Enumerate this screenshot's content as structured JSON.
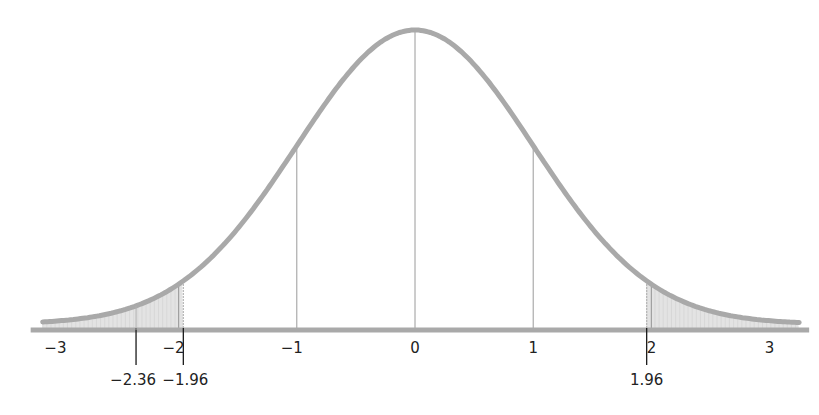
{
  "chart_data": {
    "type": "area",
    "title": "",
    "subtitle": "",
    "xlabel": "",
    "ylabel": "",
    "distribution": "standard normal",
    "xlim": [
      -3.15,
      3.25
    ],
    "ylim": [
      0,
      0.4
    ],
    "grid": false,
    "legend": null,
    "x_ticks": [
      -3,
      -2,
      -1,
      0,
      1,
      2,
      3
    ],
    "x_tick_labels": [
      "−3",
      "−2",
      "−1",
      "0",
      "1",
      "2",
      "3"
    ],
    "reference_lines": [
      -1,
      0,
      1
    ],
    "shaded_regions": [
      {
        "from": -3.15,
        "to": -1.96,
        "label": "lower tail"
      },
      {
        "from": 1.96,
        "to": 3.25,
        "label": "upper tail"
      }
    ],
    "markers": [
      {
        "x": -2.36,
        "label": "−2.36"
      },
      {
        "x": -1.96,
        "label": "−1.96"
      },
      {
        "x": 1.96,
        "label": "1.96"
      }
    ],
    "colors": {
      "curve": "#a9a9a9",
      "axis": "#a9a9a9",
      "shade": "#e3e3e3",
      "reference_line": "#9a9a9a",
      "marker_line": "#1a1a1a",
      "text": "#222222"
    }
  }
}
